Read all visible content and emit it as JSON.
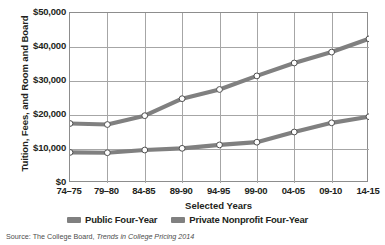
{
  "chart_data": {
    "type": "line",
    "title": "",
    "xlabel": "Selected Years",
    "ylabel": "Tuition, Fees, and Room and Board",
    "categories": [
      "74–75",
      "79–80",
      "84-85",
      "89-90",
      "94-95",
      "99-00",
      "04-05",
      "09-10",
      "14-15"
    ],
    "series": [
      {
        "name": "Public Four-Year",
        "color": "#808080",
        "values": [
          9000,
          8900,
          9700,
          10200,
          11200,
          12000,
          15000,
          17700,
          19500
        ]
      },
      {
        "name": "Private Nonprofit Four-Year",
        "color": "#808080",
        "values": [
          17500,
          17200,
          19800,
          24800,
          27500,
          31500,
          35300,
          38500,
          42400
        ]
      }
    ],
    "ylim": [
      0,
      50000
    ],
    "ytick_values": [
      0,
      10000,
      20000,
      30000,
      40000,
      50000
    ],
    "ytick_labels": [
      "$0",
      "$10,000",
      "$20,000",
      "$30,000",
      "$40,000",
      "$50,000"
    ],
    "grid": "both",
    "legend_position": "bottom",
    "marker": "open-circle"
  },
  "axes": {
    "y_title": "Tuition, Fees, and Room and Board",
    "x_title": "Selected Years"
  },
  "legend": {
    "items": [
      {
        "label": "Public Four-Year",
        "color": "#808080"
      },
      {
        "label": "Private Nonprofit Four-Year",
        "color": "#808080"
      }
    ]
  },
  "source": {
    "prefix": "Source: The College Board, ",
    "title": "Trends in College Pricing 2014"
  },
  "colors": {
    "line": "#808080",
    "grid": "#a6a6a6",
    "frame": "#8d8d8d",
    "text": "#231f20",
    "source_text": "#4d4d4d",
    "background": "#ffffff"
  }
}
